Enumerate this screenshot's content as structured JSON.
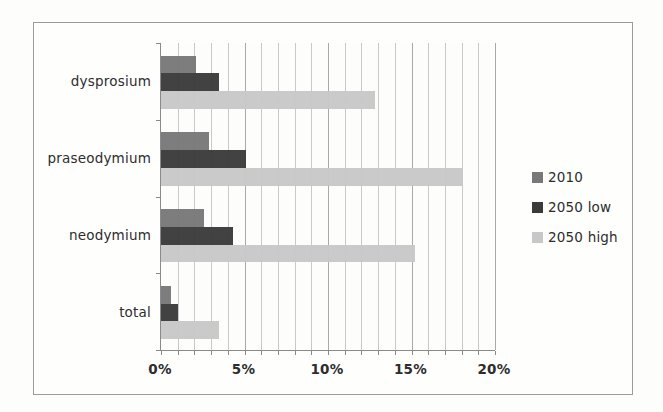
{
  "figure": {
    "background": "#fdfdfc",
    "frame_border_color": "#9b9b9b",
    "grid_minor_color": "#c9c9c9",
    "grid_major_color": "#a9a9a9",
    "axis_color": "#8a8a8a",
    "text_color": "#2d2d2d"
  },
  "chart_data": {
    "type": "bar",
    "orientation": "horizontal",
    "title": "",
    "xlabel": "",
    "ylabel": "",
    "categories": [
      "dysprosium",
      "praseodymium",
      "neodymium",
      "total"
    ],
    "series": [
      {
        "name": "2010",
        "color": "#787878",
        "values": [
          2.1,
          2.9,
          2.6,
          0.6
        ]
      },
      {
        "name": "2050 low",
        "color": "#3a3a3a",
        "values": [
          3.5,
          5.1,
          4.3,
          1.0
        ]
      },
      {
        "name": "2050 high",
        "color": "#c8c8c8",
        "values": [
          12.8,
          18.1,
          15.2,
          3.5
        ]
      }
    ],
    "xlim": [
      0,
      20
    ],
    "x_minor_step": 1,
    "x_major_step": 5,
    "x_tick_values": [
      0,
      5,
      10,
      15,
      20
    ],
    "x_tick_labels": [
      "0%",
      "5%",
      "10%",
      "15%",
      "20%"
    ],
    "grid": "vertical-minor-on",
    "legend_position": "right-middle",
    "legend_items": [
      "2010",
      "2050 low",
      "2050 high"
    ]
  }
}
